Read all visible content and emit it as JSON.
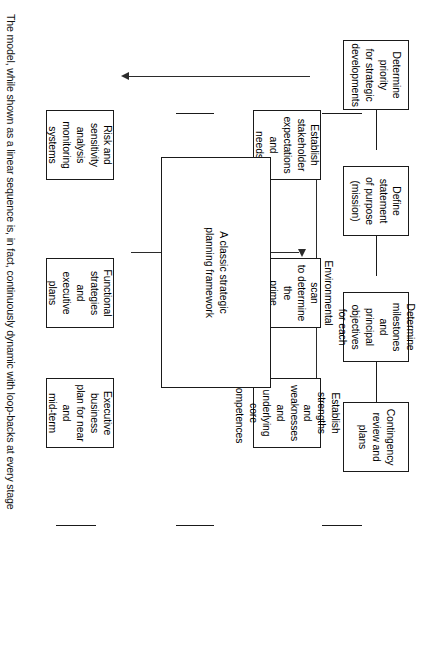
{
  "diagram": {
    "title_box": {
      "label": "A classic strategic\nplanning framework"
    },
    "top_row": [
      {
        "id": "determine-priority",
        "label": "Determine priority\nfor strategic\ndevelopments"
      },
      {
        "id": "define-statement-of-purpose",
        "label": "Define statement\nof purpose\n(mission)"
      },
      {
        "id": "determine-milestones",
        "label": "Determine\nmilestones and\nprincipal objectives\nfor each"
      },
      {
        "id": "contingency-review",
        "label": "Contingency\nreview and plans"
      }
    ],
    "left_column": [
      {
        "id": "establish-strengths",
        "label": "Establish strengths\nand weaknesses\nand underlying\ncore competences"
      },
      {
        "id": "environmental-scan",
        "label": "Environmental scan\nto determine the\nprime opportunities\navailable"
      },
      {
        "id": "establish-stakeholder",
        "label": "Establish stakeholder\nexpectations and\nneeds"
      }
    ],
    "right_column": [
      {
        "id": "executive-business-plan",
        "label": "Executive business\nplan for near and\nmid-term"
      },
      {
        "id": "functional-strategies",
        "label": "Functional strategies\nand executive plans"
      },
      {
        "id": "risk-and-sensitivity",
        "label": "Risk and sensitivity\nanalysis\nmonitoring systems"
      }
    ],
    "footnote": "The model, while shown as a linear sequence is, in fact, continuously dynamic with loop-backs at every stage",
    "colors": {
      "stroke": "#1a1a1a",
      "arrow": "#2b2b2b",
      "background": "#ffffff",
      "text": "#000000"
    }
  }
}
